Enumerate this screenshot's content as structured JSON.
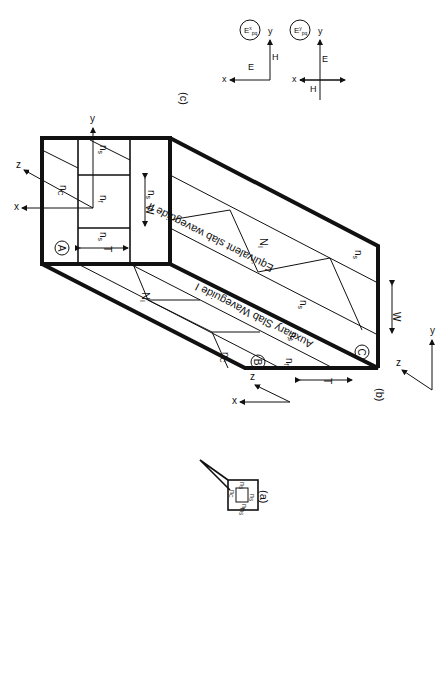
{
  "figure": {
    "panel_labels": {
      "a": "(a)",
      "b": "(b)",
      "c": "(c)"
    },
    "panel_a": {
      "labels": {
        "n_c": "n",
        "n_c_sub": "C",
        "n_f": "n",
        "n_f_sub": "f",
        "n_s_left": "n",
        "n_s_left_sub": "S",
        "n_s_right": "n",
        "n_s_right_sub": "S",
        "n_s_bottom": "n",
        "n_s_bottom_sub": "S"
      }
    },
    "panel_b": {
      "corner_labels": {
        "A": "A",
        "B": "B",
        "C": "C"
      },
      "auxiliary_title": "Auxiliary Slab Waveguide I",
      "equivalent_title": "Equivalent slab waveguide II",
      "front_face": {
        "n_c": "n",
        "n_c_sub": "C",
        "n_f": "n",
        "n_f_sub": "f",
        "n_s_left": "n",
        "n_s_left_sub": "s",
        "n_s_bottom": "n",
        "n_s_bottom_sub": "s",
        "n_s_top": "n",
        "n_s_top_sub": "s",
        "T": "T",
        "W": "W"
      },
      "auxiliary_face": {
        "n_c": "n",
        "n_c_sub": "C",
        "n_f": "n",
        "n_f_sub": "f",
        "n_s": "n",
        "n_s_sub": "s",
        "N": "N",
        "N_sub": "I",
        "T": "T"
      },
      "equivalent_face": {
        "n_s_1": "n",
        "n_s_1_sub": "s",
        "n_s_2": "n",
        "n_s_2_sub": "s",
        "N": "N",
        "N_sub": "I",
        "W": "W"
      },
      "axes_front": {
        "x": "x",
        "y": "y",
        "z": "z"
      },
      "axes_bottom_left": {
        "x": "x",
        "z": "z"
      },
      "axes_bottom_right": {
        "y": "y",
        "z": "z"
      }
    },
    "panel_c": {
      "mode_x": {
        "label": "E",
        "sup": "x",
        "sub": "pq",
        "E": "E",
        "H": "H",
        "x": "x",
        "y": "y"
      },
      "mode_y": {
        "label": "E",
        "sup": "y",
        "sub": "pq",
        "E": "E",
        "H": "H",
        "x": "x",
        "y": "y"
      }
    }
  }
}
